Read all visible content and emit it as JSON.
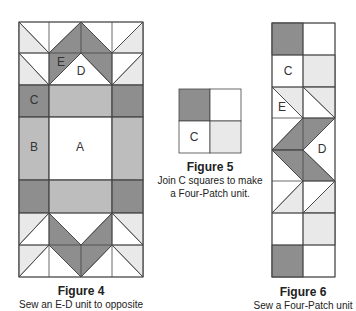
{
  "colors": {
    "dark": "#8e8e8e",
    "medium": "#bdbdbd",
    "light": "#e9e9e9",
    "white": "#ffffff",
    "line": "#444444"
  },
  "figure4": {
    "title": "Figure 4",
    "caption": "Sew an E-D unit to opposite",
    "labels": {
      "E": "E",
      "D": "D",
      "C": "C",
      "B": "B",
      "A": "A"
    }
  },
  "figure5": {
    "title": "Figure 5",
    "caption_line1": "Join C squares to make",
    "caption_line2": "a Four-Patch unit.",
    "labels": {
      "C": "C"
    }
  },
  "figure6": {
    "title": "Figure 6",
    "caption": "Sew a Four-Patch unit",
    "labels": {
      "C": "C",
      "E": "E",
      "D": "D"
    }
  }
}
